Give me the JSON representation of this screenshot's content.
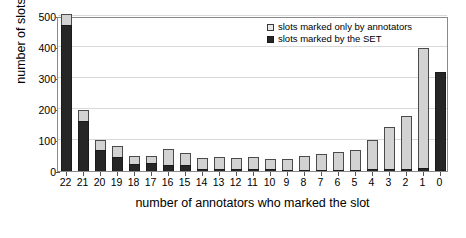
{
  "chart_data": {
    "type": "bar",
    "stacked": true,
    "title": "",
    "xlabel": "number of annotators who marked the slot",
    "ylabel": "number of slots",
    "categories": [
      "22",
      "21",
      "20",
      "19",
      "18",
      "17",
      "16",
      "15",
      "14",
      "13",
      "12",
      "11",
      "10",
      "9",
      "8",
      "7",
      "6",
      "5",
      "4",
      "3",
      "2",
      "1",
      "0"
    ],
    "ylim": [
      0,
      500
    ],
    "yticks": [
      0,
      100,
      200,
      300,
      400,
      500
    ],
    "grid": true,
    "legend_position": "top-right",
    "series": [
      {
        "name": "slots marked by the SET",
        "color": "#262626",
        "values": [
          470,
          160,
          68,
          44,
          22,
          25,
          20,
          20,
          8,
          7,
          6,
          5,
          5,
          3,
          4,
          4,
          4,
          4,
          6,
          8,
          8,
          10,
          320
        ]
      },
      {
        "name": "slots marked only by annotators",
        "color": "#d2d2d2",
        "values": [
          35,
          36,
          33,
          36,
          28,
          25,
          52,
          38,
          33,
          38,
          35,
          40,
          35,
          37,
          45,
          52,
          58,
          63,
          93,
          135,
          168,
          388,
          0
        ]
      }
    ],
    "totals": [
      505,
      196,
      101,
      80,
      50,
      50,
      72,
      58,
      41,
      45,
      41,
      45,
      40,
      40,
      49,
      56,
      62,
      67,
      99,
      143,
      176,
      398,
      320
    ]
  },
  "legend": {
    "items": [
      {
        "label": "slots marked only by annotators",
        "swatch": "light-square-icon"
      },
      {
        "label": "slots marked by the SET",
        "swatch": "dark-square-icon"
      }
    ]
  },
  "axes": {
    "y_title": "number of slots",
    "x_title": "number of annotators who marked the slot",
    "y_tick_labels": [
      "500",
      "400",
      "300",
      "200",
      "100",
      "0"
    ],
    "x_tick_labels": [
      "22",
      "21",
      "20",
      "19",
      "18",
      "17",
      "16",
      "15",
      "14",
      "13",
      "12",
      "11",
      "10",
      "9",
      "8",
      "7",
      "6",
      "5",
      "4",
      "3",
      "2",
      "1",
      "0"
    ]
  }
}
